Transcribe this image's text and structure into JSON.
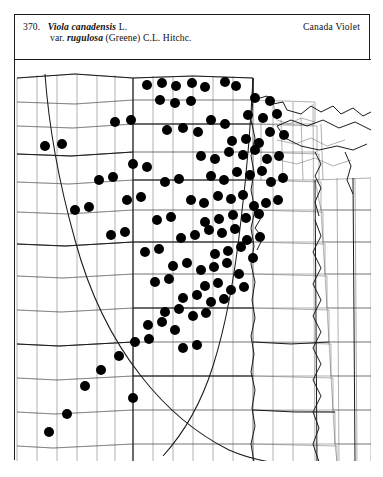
{
  "plate": {
    "number": "370.",
    "scientific_name": "Viola canadensis",
    "authority_1": "L.",
    "variety_prefix": "var.",
    "variety_name": "rugulosa",
    "authority_2": "(Greene) C.L. Hitchc.",
    "common_name": "Canada Violet"
  },
  "map": {
    "type": "county-level-dot-distribution-map",
    "region": "Great Plains of North America",
    "symbol": "filled-black-circle",
    "symbol_meaning": "county record of occurrence",
    "line_color": "#2a2a2a",
    "dot_color": "#000000",
    "background_color": "#ffffff",
    "features": [
      "state-boundaries",
      "county-boundaries",
      "great-plains-boundary-line",
      "lake-superior",
      "lake-michigan",
      "missouri-river"
    ],
    "dot_count": 118,
    "dots": [
      [
        132,
        25
      ],
      [
        147,
        23
      ],
      [
        161,
        26
      ],
      [
        177,
        23
      ],
      [
        190,
        27
      ],
      [
        210,
        22
      ],
      [
        221,
        26
      ],
      [
        145,
        40
      ],
      [
        160,
        43
      ],
      [
        176,
        41
      ],
      [
        240,
        38
      ],
      [
        255,
        41
      ],
      [
        100,
        62
      ],
      [
        116,
        60
      ],
      [
        30,
        86
      ],
      [
        47,
        84
      ],
      [
        152,
        70
      ],
      [
        168,
        68
      ],
      [
        183,
        72
      ],
      [
        196,
        60
      ],
      [
        210,
        64
      ],
      [
        233,
        55
      ],
      [
        248,
        58
      ],
      [
        262,
        54
      ],
      [
        217,
        81
      ],
      [
        231,
        79
      ],
      [
        244,
        83
      ],
      [
        255,
        72
      ],
      [
        269,
        75
      ],
      [
        186,
        96
      ],
      [
        200,
        99
      ],
      [
        214,
        92
      ],
      [
        228,
        95
      ],
      [
        240,
        90
      ],
      [
        252,
        99
      ],
      [
        264,
        96
      ],
      [
        118,
        104
      ],
      [
        132,
        107
      ],
      [
        84,
        120
      ],
      [
        98,
        117
      ],
      [
        150,
        122
      ],
      [
        164,
        119
      ],
      [
        196,
        116
      ],
      [
        209,
        120
      ],
      [
        222,
        112
      ],
      [
        235,
        115
      ],
      [
        247,
        111
      ],
      [
        256,
        122
      ],
      [
        268,
        118
      ],
      [
        112,
        140
      ],
      [
        126,
        137
      ],
      [
        60,
        150
      ],
      [
        74,
        147
      ],
      [
        176,
        140
      ],
      [
        189,
        143
      ],
      [
        203,
        136
      ],
      [
        216,
        139
      ],
      [
        228,
        135
      ],
      [
        239,
        146
      ],
      [
        251,
        143
      ],
      [
        263,
        140
      ],
      [
        142,
        160
      ],
      [
        156,
        157
      ],
      [
        190,
        162
      ],
      [
        204,
        159
      ],
      [
        218,
        155
      ],
      [
        231,
        158
      ],
      [
        244,
        154
      ],
      [
        96,
        175
      ],
      [
        110,
        172
      ],
      [
        166,
        178
      ],
      [
        180,
        175
      ],
      [
        194,
        170
      ],
      [
        207,
        173
      ],
      [
        220,
        169
      ],
      [
        232,
        180
      ],
      [
        245,
        177
      ],
      [
        130,
        192
      ],
      [
        144,
        189
      ],
      [
        200,
        194
      ],
      [
        213,
        191
      ],
      [
        226,
        187
      ],
      [
        238,
        198
      ],
      [
        158,
        206
      ],
      [
        172,
        203
      ],
      [
        186,
        210
      ],
      [
        199,
        207
      ],
      [
        212,
        203
      ],
      [
        224,
        214
      ],
      [
        140,
        222
      ],
      [
        154,
        219
      ],
      [
        190,
        226
      ],
      [
        203,
        223
      ],
      [
        216,
        230
      ],
      [
        229,
        227
      ],
      [
        168,
        238
      ],
      [
        182,
        235
      ],
      [
        196,
        242
      ],
      [
        209,
        239
      ],
      [
        150,
        252
      ],
      [
        164,
        249
      ],
      [
        178,
        256
      ],
      [
        191,
        253
      ],
      [
        133,
        265
      ],
      [
        147,
        262
      ],
      [
        160,
        270
      ],
      [
        120,
        282
      ],
      [
        134,
        279
      ],
      [
        104,
        296
      ],
      [
        86,
        310
      ],
      [
        70,
        326
      ],
      [
        118,
        338
      ],
      [
        52,
        354
      ],
      [
        34,
        372
      ],
      [
        168,
        288
      ],
      [
        182,
        285
      ]
    ]
  }
}
